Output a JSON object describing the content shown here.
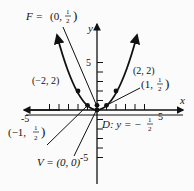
{
  "diagram": {
    "type": "parabola-graph",
    "equation_implied": "x^2 = 2y",
    "axes": {
      "x_label": "x",
      "y_label": "y",
      "x_tick_labels": [
        "-5",
        "5"
      ],
      "y_tick_labels": [
        "5",
        "-5"
      ]
    },
    "labels": {
      "focus": "F = (0, 1/2)",
      "focus_prefix": "F = ",
      "focus_point": "(0, ",
      "focus_frac_num": "1",
      "focus_frac_den": "2",
      "vertex": "V = (0, 0)",
      "directrix": "D: y = −",
      "directrix_frac_num": "1",
      "directrix_frac_den": "2",
      "point_neg2": "(−2, 2)",
      "point_2": "(2, 2)",
      "point_1": "(1, ",
      "point_neg1": "(−1, ",
      "half_num": "1",
      "half_den": "2",
      "close_paren": ")"
    },
    "points": [
      {
        "x": -2,
        "y": 2
      },
      {
        "x": 2,
        "y": 2
      },
      {
        "x": 1,
        "y": 0.5
      },
      {
        "x": -1,
        "y": 0.5
      },
      {
        "x": 0,
        "y": 0
      },
      {
        "x": 0,
        "y": 0.5
      }
    ],
    "colors": {
      "ink": "#111111",
      "background": "#fbfbfb"
    }
  }
}
